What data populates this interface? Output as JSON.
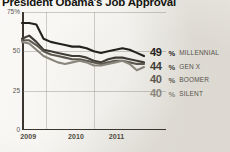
{
  "chart_data": {
    "type": "line",
    "title": "President Obama's Job Approval",
    "xlabel": "",
    "ylabel": "",
    "ylim": [
      0,
      75
    ],
    "yticks": [
      "75%",
      "50",
      "25",
      "0"
    ],
    "ytick_values": [
      75,
      50,
      25,
      0
    ],
    "xticks": [
      "2009",
      "2010",
      "2011"
    ],
    "grid": true,
    "legend_position": "right",
    "x": [
      2009.0,
      2009.15,
      2009.3,
      2009.45,
      2009.6,
      2009.75,
      2009.9,
      2010.05,
      2010.2,
      2010.35,
      2010.5,
      2010.65,
      2010.8,
      2010.95,
      2011.1,
      2011.25,
      2011.4,
      2011.55
    ],
    "series": [
      {
        "name": "MILLENNIAL",
        "color": "#23211c",
        "end_value": 49,
        "end_label": "49%",
        "values": [
          68,
          68,
          67,
          58,
          56,
          55,
          54,
          53,
          53,
          52,
          50,
          49,
          50,
          51,
          52,
          51,
          49,
          47
        ]
      },
      {
        "name": "GEN X",
        "color": "#3f3c35",
        "end_value": 44,
        "end_label": "44%",
        "values": [
          58,
          60,
          56,
          51,
          50,
          49,
          48,
          47,
          47,
          46,
          44,
          43,
          45,
          46,
          46,
          45,
          44,
          43
        ]
      },
      {
        "name": "BOOMER",
        "color": "#5c584f",
        "end_value": 40,
        "end_label": "40%",
        "values": [
          57,
          57,
          54,
          50,
          48,
          47,
          46,
          45,
          45,
          44,
          43,
          42,
          43,
          44,
          44,
          43,
          42,
          42
        ]
      },
      {
        "name": "SILENT",
        "color": "#8a867c",
        "end_value": 40,
        "end_label": "40%",
        "values": [
          56,
          55,
          51,
          47,
          45,
          43,
          42,
          43,
          44,
          43,
          41,
          41,
          42,
          43,
          44,
          42,
          38,
          40
        ]
      }
    ]
  },
  "legend": {
    "rows": [
      {
        "value": "49",
        "pct": "%",
        "label": "MILLENNIAL"
      },
      {
        "value": "44",
        "pct": "%",
        "label": "GEN X"
      },
      {
        "value": "40",
        "pct": "%",
        "label": "BOOMER"
      },
      {
        "value": "40",
        "pct": "%",
        "label": "SILENT"
      }
    ]
  }
}
